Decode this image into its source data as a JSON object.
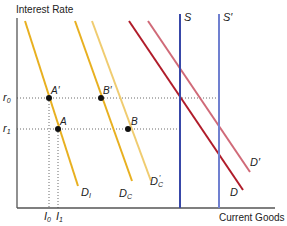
{
  "diagram": {
    "y_axis_label": "Interest Rate",
    "x_axis_label": "Current Goods",
    "rate_labels": {
      "r0": "r",
      "r0_sub": "0",
      "r1": "r",
      "r1_sub": "1"
    },
    "investment_labels": {
      "I0": "I",
      "I0_sub": "0",
      "I1": "I",
      "I1_sub": "1"
    },
    "points": [
      {
        "id": "A_prime",
        "label": "A′"
      },
      {
        "id": "A",
        "label": "A"
      },
      {
        "id": "B_prime",
        "label": "B′"
      },
      {
        "id": "B",
        "label": "B"
      }
    ],
    "curves": {
      "DI": {
        "label": "D",
        "sub": "I",
        "color": "#e8b020"
      },
      "DC": {
        "label": "D",
        "sub": "C",
        "color": "#e8b020"
      },
      "DCp": {
        "label": "D",
        "sub": "C",
        "prime": "′",
        "color": "#f0cc70"
      },
      "D": {
        "label": "D",
        "color": "#b01c2a"
      },
      "Dp": {
        "label": "D′",
        "color": "#d06a78"
      },
      "S": {
        "label": "S",
        "color": "#3848a8"
      },
      "Sp": {
        "label": "S′",
        "color": "#7080d0"
      }
    }
  }
}
